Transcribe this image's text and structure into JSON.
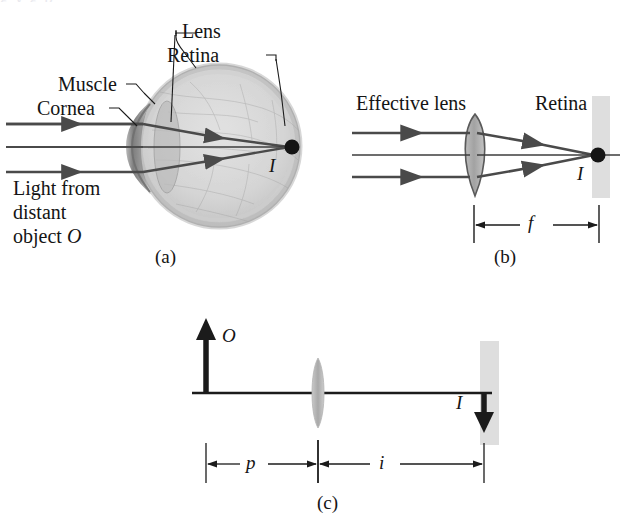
{
  "figure": {
    "caption_top_partial": "g y g p",
    "panels": [
      {
        "id": "a",
        "label": "(a)"
      },
      {
        "id": "b",
        "label": "(b)"
      },
      {
        "id": "c",
        "label": "(c)"
      }
    ]
  },
  "panel_a": {
    "label": "(a)",
    "labels": {
      "lens": "Lens",
      "retina": "Retina",
      "muscle": "Muscle",
      "cornea": "Cornea",
      "light_line1": "Light from",
      "light_line2": "distant",
      "light_line3": "object ",
      "light_object_symbol": "O",
      "image_point": "I"
    }
  },
  "panel_b": {
    "label": "(b)",
    "labels": {
      "effective_lens": "Effective lens",
      "retina": "Retina",
      "image_point": "I",
      "focal_length": "f"
    }
  },
  "panel_c": {
    "label": "(c)",
    "labels": {
      "object": "O",
      "image": "I",
      "object_distance": "p",
      "image_distance": "i"
    }
  },
  "colors": {
    "ray": "#4a4a4a",
    "ink": "#141414",
    "eye_sclera": "#c9c9c9",
    "eye_interior": "#d9d9d9",
    "eye_rim": "#b0b0b0",
    "cornea": "#8e8e8e",
    "lens_fill": "#a8a8a8",
    "retina_bar": "#dcdcdc",
    "background": "#ffffff"
  }
}
